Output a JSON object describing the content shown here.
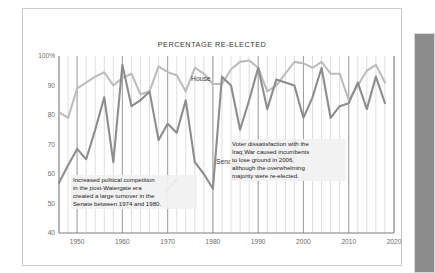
{
  "figure": {
    "title": "PERCENTAGE RE-ELECTED",
    "side_panel_name": "scroll-panel"
  },
  "annotations": {
    "left": "Increased political competition\nin the post-Watergate era\ncreated a large turnover in the\nSenate between 1974 and 1980.",
    "right": "Voter dissatisfaction with the\nIraq War caused incumbents\nto lose ground in 2006,\nalthough the overwhelming\nmajority were re-elected."
  },
  "labels": {
    "house": "House",
    "senate": "Senate"
  },
  "colors": {
    "house_line": "#bdbdbd",
    "senate_line": "#8d8d8d",
    "gridline": "#d5d5d5",
    "decade_gridline": "#8f8f8f",
    "axis": "#6d6d6d",
    "panel": "#8c8c8c",
    "text": "#232323"
  },
  "chart_data": {
    "type": "line",
    "title": "PERCENTAGE RE-ELECTED",
    "xlabel": "",
    "ylabel": "",
    "xlim": [
      1946,
      2020
    ],
    "ylim": [
      40,
      100
    ],
    "grid": true,
    "legend": "inline-labels",
    "xticks": [
      1950,
      1960,
      1970,
      1980,
      1990,
      2000,
      2010,
      2020
    ],
    "yticks": [
      40,
      50,
      60,
      70,
      80,
      90,
      100
    ],
    "ytick_labels": [
      "40",
      "50",
      "60",
      "70",
      "80",
      "90",
      "100%"
    ],
    "x": [
      1946,
      1948,
      1950,
      1952,
      1954,
      1956,
      1958,
      1960,
      1962,
      1964,
      1966,
      1968,
      1970,
      1972,
      1974,
      1976,
      1978,
      1980,
      1982,
      1984,
      1986,
      1988,
      1990,
      1992,
      1994,
      1996,
      1998,
      2000,
      2002,
      2004,
      2006,
      2008,
      2010,
      2012,
      2014,
      2016,
      2018
    ],
    "series": [
      {
        "name": "House",
        "color": "#bdbdbd",
        "values": [
          81,
          79,
          89,
          91,
          93,
          94.5,
          90,
          92.5,
          94,
          87,
          88,
          96.5,
          94.5,
          93.5,
          88,
          96,
          94,
          90.5,
          90.5,
          95.5,
          98,
          98.5,
          96,
          88,
          90,
          94,
          98,
          97.5,
          96,
          98,
          94,
          94,
          85,
          90,
          95,
          97,
          91
        ]
      },
      {
        "name": "Senate",
        "color": "#8d8d8d",
        "values": [
          57,
          63,
          68.5,
          65,
          75,
          86,
          64,
          97,
          83,
          85,
          88,
          71.5,
          77,
          74,
          85,
          64,
          60,
          55,
          93,
          90,
          75,
          85,
          96,
          82,
          92,
          91,
          90,
          79,
          86,
          96,
          79,
          83,
          84,
          91,
          82,
          93,
          84
        ]
      }
    ],
    "annotations": [
      {
        "text": "Increased political competition in the post-Watergate era created a large turnover in the Senate between 1974 and 1980.",
        "points_to_x": 1976,
        "points_to_y": 62
      },
      {
        "text": "Voter dissatisfaction with the Iraq War caused incumbents to lose ground in 2006, although the overwhelming majority were re-elected.",
        "points_to_x": 2006,
        "points_to_y": 79
      }
    ]
  }
}
